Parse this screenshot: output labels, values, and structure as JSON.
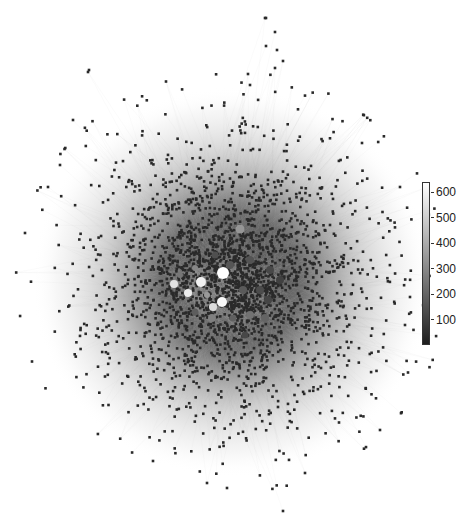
{
  "figure": {
    "type": "network-graph",
    "width": 476,
    "height": 515,
    "background": "#ffffff"
  },
  "network": {
    "center": [
      232,
      282
    ],
    "radius_x": 200,
    "radius_y": 195,
    "node_count": 2600,
    "edge_count": 3200,
    "node_radius": 1.3,
    "node_color": "#2a2a2a",
    "edge_color": "#b8b8b8",
    "edge_opacity": 0.1,
    "seed": 17,
    "outliers": [
      {
        "x": 265,
        "y": 18
      },
      {
        "x": 266,
        "y": 18
      },
      {
        "x": 275,
        "y": 32
      },
      {
        "x": 266,
        "y": 46
      },
      {
        "x": 277,
        "y": 50
      },
      {
        "x": 283,
        "y": 61
      },
      {
        "x": 275,
        "y": 68
      },
      {
        "x": 248,
        "y": 74
      },
      {
        "x": 250,
        "y": 85
      },
      {
        "x": 89,
        "y": 70
      },
      {
        "x": 88,
        "y": 72
      },
      {
        "x": 73,
        "y": 120
      },
      {
        "x": 60,
        "y": 165
      },
      {
        "x": 48,
        "y": 187
      },
      {
        "x": 25,
        "y": 233
      },
      {
        "x": 400,
        "y": 187
      },
      {
        "x": 410,
        "y": 297
      },
      {
        "x": 405,
        "y": 325
      },
      {
        "x": 207,
        "y": 483
      },
      {
        "x": 283,
        "y": 511
      },
      {
        "x": 305,
        "y": 473
      },
      {
        "x": 227,
        "y": 488
      },
      {
        "x": 153,
        "y": 461
      },
      {
        "x": 380,
        "y": 430
      }
    ]
  },
  "hubs": [
    {
      "x": 223,
      "y": 273,
      "r": 6,
      "value": 640
    },
    {
      "x": 201,
      "y": 282,
      "r": 5,
      "value": 600
    },
    {
      "x": 174,
      "y": 284,
      "r": 4,
      "value": 560
    },
    {
      "x": 188,
      "y": 293,
      "r": 4,
      "value": 590
    },
    {
      "x": 222,
      "y": 302,
      "r": 5,
      "value": 620
    },
    {
      "x": 213,
      "y": 307,
      "r": 4,
      "value": 540
    },
    {
      "x": 240,
      "y": 229,
      "r": 4.5,
      "value": 340
    },
    {
      "x": 195,
      "y": 268,
      "r": 3,
      "value": 300
    },
    {
      "x": 212,
      "y": 318,
      "r": 4,
      "value": 280
    },
    {
      "x": 250,
      "y": 315,
      "r": 4,
      "value": 240
    },
    {
      "x": 265,
      "y": 318,
      "r": 4,
      "value": 200
    },
    {
      "x": 230,
      "y": 265,
      "r": 4,
      "value": 160
    },
    {
      "x": 250,
      "y": 260,
      "r": 4,
      "value": 150
    },
    {
      "x": 243,
      "y": 290,
      "r": 4,
      "value": 170
    },
    {
      "x": 195,
      "y": 312,
      "r": 3.5,
      "value": 180
    },
    {
      "x": 260,
      "y": 290,
      "r": 4,
      "value": 130
    },
    {
      "x": 180,
      "y": 275,
      "r": 3,
      "value": 250
    },
    {
      "x": 207,
      "y": 295,
      "r": 3,
      "value": 350
    },
    {
      "x": 233,
      "y": 318,
      "r": 3.5,
      "value": 190
    },
    {
      "x": 270,
      "y": 270,
      "r": 4,
      "value": 120
    },
    {
      "x": 268,
      "y": 300,
      "r": 4,
      "value": 110
    },
    {
      "x": 215,
      "y": 255,
      "r": 3.5,
      "value": 140
    },
    {
      "x": 280,
      "y": 280,
      "r": 4,
      "value": 100
    },
    {
      "x": 245,
      "y": 335,
      "r": 3.5,
      "value": 120
    }
  ],
  "colorbar": {
    "min": 0,
    "max": 640,
    "colormap": "grey",
    "ticks": [
      {
        "label": "600",
        "value": 600
      },
      {
        "label": "500",
        "value": 500
      },
      {
        "label": "400",
        "value": 400
      },
      {
        "label": "300",
        "value": 300
      },
      {
        "label": "200",
        "value": 200
      },
      {
        "label": "100",
        "value": 100
      }
    ]
  }
}
